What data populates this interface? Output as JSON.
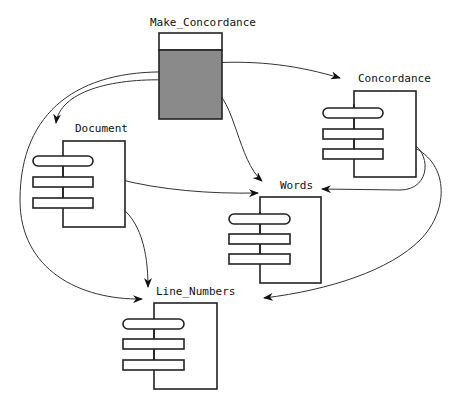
{
  "diagram": {
    "type": "Ada/Booch module dependency diagram",
    "main_unit": {
      "name": "Make_Concordance",
      "kind": "main-subprogram",
      "fill": "#8a8a8a"
    },
    "packages": [
      {
        "name": "Concordance"
      },
      {
        "name": "Document"
      },
      {
        "name": "Words"
      },
      {
        "name": "Line_Numbers"
      }
    ],
    "dependencies": [
      {
        "from": "Make_Concordance",
        "to": "Concordance"
      },
      {
        "from": "Make_Concordance",
        "to": "Document"
      },
      {
        "from": "Make_Concordance",
        "to": "Words"
      },
      {
        "from": "Make_Concordance",
        "to": "Line_Numbers"
      },
      {
        "from": "Document",
        "to": "Words"
      },
      {
        "from": "Document",
        "to": "Line_Numbers"
      },
      {
        "from": "Concordance",
        "to": "Words"
      },
      {
        "from": "Concordance",
        "to": "Line_Numbers"
      }
    ]
  },
  "labels": {
    "make_concordance": "Make_Concordance",
    "concordance": "Concordance",
    "document": "Document",
    "words": "Words",
    "line_numbers": "Line_Numbers"
  }
}
